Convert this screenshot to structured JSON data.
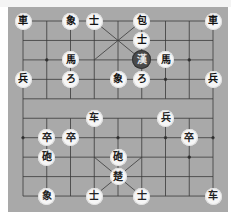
{
  "game": "xiangqi",
  "board": {
    "cols": 9,
    "rows": 10,
    "origin_x": 23,
    "origin_y": 21,
    "step_x": 23.75,
    "step_y": 19.45,
    "background": "#a9a9a9"
  },
  "selected": {
    "col": 5,
    "row": 2
  },
  "pieces": [
    {
      "id": "b-chariot-l",
      "label": "車",
      "side": "black",
      "col": 0,
      "row": 0
    },
    {
      "id": "b-elephant-l",
      "label": "象",
      "side": "black",
      "col": 2,
      "row": 0
    },
    {
      "id": "b-advisor-l",
      "label": "士",
      "side": "black",
      "col": 3,
      "row": 0
    },
    {
      "id": "b-cannon-1",
      "label": "包",
      "side": "black",
      "col": 5,
      "row": 0
    },
    {
      "id": "b-chariot-r",
      "label": "車",
      "side": "black",
      "col": 8,
      "row": 0
    },
    {
      "id": "b-advisor-r",
      "label": "士",
      "side": "black",
      "col": 5,
      "row": 1
    },
    {
      "id": "b-horse-l",
      "label": "馬",
      "side": "black",
      "col": 2,
      "row": 2
    },
    {
      "id": "b-general",
      "label": "漢",
      "side": "black",
      "col": 5,
      "row": 2,
      "selected": true
    },
    {
      "id": "b-horse-r",
      "label": "馬",
      "side": "black",
      "col": 6,
      "row": 2
    },
    {
      "id": "b-soldier-1",
      "label": "兵",
      "side": "black",
      "col": 0,
      "row": 3
    },
    {
      "id": "b-cannon-2",
      "label": "ろ",
      "side": "black",
      "col": 2,
      "row": 3
    },
    {
      "id": "b-elephant-r",
      "label": "象",
      "side": "black",
      "col": 4,
      "row": 3
    },
    {
      "id": "b-cannon-3",
      "label": "ろ",
      "side": "black",
      "col": 5,
      "row": 3
    },
    {
      "id": "b-soldier-2",
      "label": "兵",
      "side": "black",
      "col": 8,
      "row": 3
    },
    {
      "id": "r-chariot-1",
      "label": "车",
      "side": "red",
      "col": 3,
      "row": 5
    },
    {
      "id": "r-soldier-1",
      "label": "兵",
      "side": "red",
      "col": 6,
      "row": 5
    },
    {
      "id": "r-pawn-1",
      "label": "卒",
      "side": "red",
      "col": 1,
      "row": 6
    },
    {
      "id": "r-pawn-2",
      "label": "卒",
      "side": "red",
      "col": 2,
      "row": 6
    },
    {
      "id": "r-pawn-3",
      "label": "卒",
      "side": "red",
      "col": 7,
      "row": 6
    },
    {
      "id": "r-cannon-1",
      "label": "砲",
      "side": "red",
      "col": 1,
      "row": 7
    },
    {
      "id": "r-cannon-2",
      "label": "砲",
      "side": "red",
      "col": 4,
      "row": 7
    },
    {
      "id": "r-general",
      "label": "楚",
      "side": "red",
      "col": 4,
      "row": 8
    },
    {
      "id": "r-elephant-1",
      "label": "象",
      "side": "red",
      "col": 1,
      "row": 9
    },
    {
      "id": "r-advisor-1",
      "label": "士",
      "side": "red",
      "col": 3,
      "row": 9
    },
    {
      "id": "r-advisor-2",
      "label": "士",
      "side": "red",
      "col": 5,
      "row": 9
    },
    {
      "id": "r-chariot-2",
      "label": "车",
      "side": "red",
      "col": 8,
      "row": 9
    }
  ]
}
